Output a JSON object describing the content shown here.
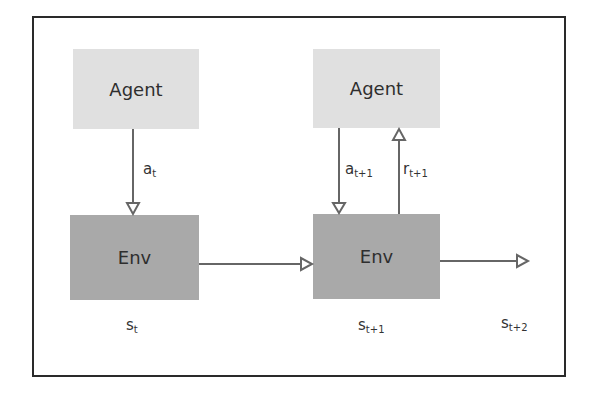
{
  "diagram": {
    "type": "reinforcement-learning-loop",
    "nodes": [
      {
        "id": "agent1",
        "label": "Agent"
      },
      {
        "id": "env1",
        "label": "Env"
      },
      {
        "id": "agent2",
        "label": "Agent"
      },
      {
        "id": "env2",
        "label": "Env"
      }
    ],
    "edges": [
      {
        "from": "agent1",
        "to": "env1",
        "label_main": "a",
        "label_sub": "t"
      },
      {
        "from": "env1",
        "to": "env2",
        "label_main": "",
        "label_sub": ""
      },
      {
        "from": "agent2",
        "to": "env2",
        "label_main": "a",
        "label_sub": "t+1"
      },
      {
        "from": "env2",
        "to": "agent2",
        "label_main": "r",
        "label_sub": "t+1"
      },
      {
        "from": "env2",
        "to": "out",
        "label_main": "",
        "label_sub": ""
      }
    ],
    "state_labels": [
      {
        "main": "s",
        "sub": "t"
      },
      {
        "main": "s",
        "sub": "t+1"
      },
      {
        "main": "s",
        "sub": "t+2"
      }
    ],
    "colors": {
      "agent_fill": "#e0e0e0",
      "env_fill": "#a9a9a9",
      "arrow": "#666666",
      "frame": "#2a2a2a"
    }
  }
}
